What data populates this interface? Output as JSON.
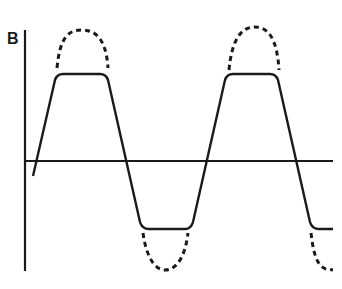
{
  "diagram": {
    "type": "waveform",
    "axis_label": "B",
    "curves": [
      {
        "name": "clipped-flux-waveform",
        "style": "solid",
        "description": "Flattened (saturated) sinusoid"
      },
      {
        "name": "ideal-sinusoid-peaks",
        "style": "dashed",
        "description": "Unclipped sinusoidal peaks"
      }
    ],
    "colors": {
      "stroke": "#1a1a1a",
      "background": "#ffffff"
    }
  }
}
